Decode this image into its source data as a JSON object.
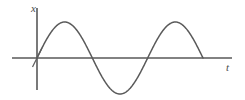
{
  "figure": {
    "background_color": "#ffffff",
    "line_color": "#5a5a5a",
    "axis_color": "#585858",
    "label_color": "#4d4d4d",
    "width": 245,
    "height": 100
  },
  "axes": {
    "y_axis": {
      "label": "x",
      "label_name": "vertical-axis-label",
      "x_pixel": 37,
      "top_pixel": 8,
      "bottom_pixel": 90
    },
    "x_axis": {
      "label": "t",
      "label_name": "horizontal-axis-label",
      "y_pixel": 58,
      "left_pixel": 12,
      "right_pixel": 232
    },
    "origin_tick": {
      "present": true,
      "description": "short diagonal tick at origin"
    }
  },
  "chart_data": {
    "type": "line",
    "title": "",
    "subtitle": "",
    "xlabel": "t",
    "ylabel": "x",
    "grid": false,
    "legend": null,
    "xlim": [
      0,
      2.07
    ],
    "ylim": [
      -1.1,
      1.1
    ],
    "series": [
      {
        "name": "x(t)",
        "function": "sine",
        "amplitude": 1.0,
        "periods_shown": 2.0,
        "phase": 0,
        "x": [
          0,
          0.1,
          0.2,
          0.25,
          0.3,
          0.4,
          0.5,
          0.6,
          0.7,
          0.75,
          0.8,
          0.9,
          1.0,
          1.1,
          1.2,
          1.25,
          1.3,
          1.4,
          1.5,
          1.6,
          1.7,
          1.75,
          1.8,
          1.9,
          2.0
        ],
        "values": [
          0,
          0.588,
          0.951,
          1.0,
          0.951,
          0.588,
          0,
          -0.588,
          -0.951,
          -1.0,
          -0.951,
          -0.588,
          0,
          0.588,
          0.951,
          1.0,
          0.951,
          0.588,
          0,
          -0.588,
          -0.951,
          -1.0,
          -0.951,
          -0.588,
          0
        ]
      }
    ],
    "key_points": {
      "start": {
        "t": 0,
        "x": 0
      },
      "first_peak": {
        "t": 0.25,
        "x": 1.0
      },
      "first_zero_descending": {
        "t": 0.5,
        "x": 0
      },
      "trough": {
        "t": 0.75,
        "x": -1.0
      },
      "second_zero_ascending": {
        "t": 1.0,
        "x": 0
      },
      "second_peak": {
        "t": 1.25,
        "x": 1.0
      },
      "end": {
        "t": 1.5,
        "x": 0
      }
    },
    "annotations": []
  }
}
